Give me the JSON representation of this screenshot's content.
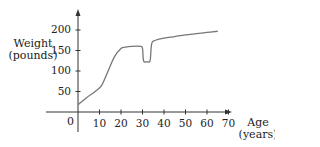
{
  "chart_data": {
    "type": "line",
    "title": "",
    "xlabel": "Age (years)",
    "ylabel": "Weight (pounds)",
    "xlabel_lines": [
      "Age",
      "(years)"
    ],
    "ylabel_lines": [
      "Weight",
      "(pounds)"
    ],
    "origin_label": "0",
    "xlim": [
      0,
      75
    ],
    "ylim": [
      0,
      210
    ],
    "x_ticks": [
      10,
      20,
      30,
      40,
      50,
      60,
      70
    ],
    "y_ticks": [
      50,
      100,
      150,
      200
    ],
    "grid": false,
    "legend": null,
    "series": [
      {
        "name": "Weight",
        "color": "#777777",
        "x": [
          0,
          4,
          8,
          11,
          14,
          17,
          20,
          22,
          25,
          29,
          30,
          30.5,
          32,
          33.5,
          34,
          34.5,
          36,
          40,
          45,
          50,
          55,
          60,
          65
        ],
        "y": [
          18,
          35,
          50,
          65,
          100,
          135,
          155,
          158,
          160,
          160,
          155,
          125,
          123,
          125,
          155,
          170,
          175,
          180,
          184,
          188,
          191,
          194,
          197
        ]
      }
    ]
  }
}
